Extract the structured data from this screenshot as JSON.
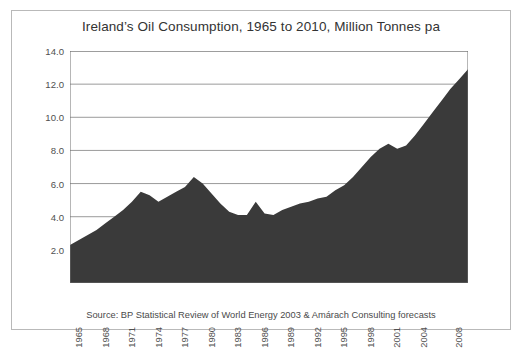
{
  "figure": {
    "title": "Ireland’s Oil Consumption, 1965 to 2010, Million Tonnes pa",
    "source": "Source: BP Statistical Review of World Energy 2003 & Amárach Consulting forecasts",
    "frame_color": "#b9b9b9",
    "background": "#ffffff"
  },
  "chart_data": {
    "type": "area",
    "title": "Ireland’s Oil Consumption, 1965 to 2010, Million Tonnes pa",
    "xlabel": "",
    "ylabel": "",
    "ylim": [
      0,
      14
    ],
    "xlim": [
      1965,
      2010
    ],
    "grid": true,
    "legend": null,
    "series_color": "#3a3a3a",
    "gridline_color": "#808080",
    "axis_color": "#6e6e6e",
    "yticks": [
      2.0,
      4.0,
      6.0,
      8.0,
      10.0,
      12.0,
      14.0
    ],
    "ytick_labels": [
      "2.0",
      "4.0",
      "6.0",
      "8.0",
      "10.0",
      "12.0",
      "14.0"
    ],
    "xtick_labels": [
      "1965",
      "1968",
      "1971",
      "1974",
      "1977",
      "1980",
      "1983",
      "1986",
      "1989",
      "1992",
      "1995",
      "1998",
      "2001",
      "2004",
      "2008"
    ],
    "xtick_years": [
      1965,
      1968,
      1971,
      1974,
      1977,
      1980,
      1983,
      1986,
      1989,
      1992,
      1995,
      1998,
      2001,
      2004,
      2008
    ],
    "x": [
      1965,
      1966,
      1967,
      1968,
      1969,
      1970,
      1971,
      1972,
      1973,
      1974,
      1975,
      1976,
      1977,
      1978,
      1979,
      1980,
      1981,
      1982,
      1983,
      1984,
      1985,
      1986,
      1987,
      1988,
      1989,
      1990,
      1991,
      1992,
      1993,
      1994,
      1995,
      1996,
      1997,
      1998,
      1999,
      2000,
      2001,
      2002,
      2003,
      2004,
      2005,
      2006,
      2007,
      2008,
      2009,
      2010
    ],
    "values": [
      2.3,
      2.6,
      2.9,
      3.2,
      3.6,
      4.0,
      4.4,
      4.9,
      5.5,
      5.3,
      4.9,
      5.2,
      5.5,
      5.8,
      6.4,
      6.0,
      5.4,
      4.8,
      4.3,
      4.1,
      4.1,
      4.9,
      4.2,
      4.1,
      4.4,
      4.6,
      4.8,
      4.9,
      5.1,
      5.2,
      5.6,
      5.9,
      6.4,
      7.0,
      7.6,
      8.1,
      8.4,
      8.1,
      8.3,
      8.9,
      9.6,
      10.3,
      11.0,
      11.7,
      12.3,
      12.9
    ]
  }
}
